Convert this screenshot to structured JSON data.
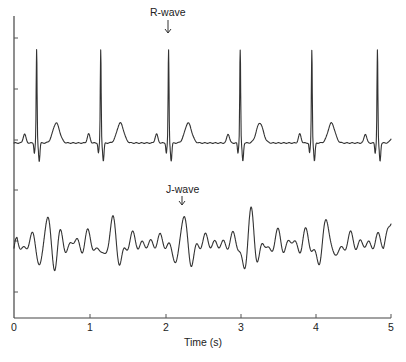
{
  "chart_data": {
    "type": "line",
    "title": "",
    "xlabel": "Time (s)",
    "ylabel": "",
    "xlim": [
      0,
      5
    ],
    "x_ticks": [
      0,
      1,
      2,
      3,
      4,
      5
    ],
    "x_tick_labels": [
      "0",
      "1",
      "2",
      "3",
      "4",
      "5"
    ],
    "y_tick_labels": [],
    "grid": false,
    "legend": null,
    "series": [
      {
        "name": "ECG",
        "description": "Upper trace: normal ECG with sharp R-wave peaks",
        "r_peak_times_s": [
          0.3,
          1.15,
          2.05,
          3.0,
          3.95,
          4.82
        ],
        "annotation": {
          "text": "R-wave",
          "time_s": 2.05
        }
      },
      {
        "name": "J-wave signal",
        "description": "Lower trace: oscillatory signal with J-wave peaks",
        "major_peak_times_s": [
          0.45,
          1.3,
          2.25,
          3.15,
          4.15
        ],
        "annotation": {
          "text": "J-wave",
          "time_s": 2.25
        }
      }
    ],
    "annotations": [
      "R-wave",
      "J-wave"
    ]
  },
  "labels": {
    "r_wave": "R-wave",
    "j_wave": "J-wave",
    "x_axis_title": "Time (s)",
    "x_ticks": [
      "0",
      "1",
      "2",
      "3",
      "4",
      "5"
    ]
  }
}
